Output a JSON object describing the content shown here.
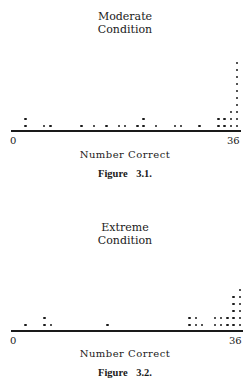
{
  "chart_data": [
    {
      "type": "scatter",
      "subtype": "dot-plot",
      "title": "Moderate Condition",
      "title_lines": [
        "Moderate",
        "Condition"
      ],
      "xlabel": "Number Correct",
      "ylabel": "",
      "xlim": [
        0,
        36
      ],
      "x_tick_labels": [
        "0",
        "36"
      ],
      "grid": false,
      "legend": null,
      "caption": "Figure 3.1.",
      "points": [
        {
          "score": 2,
          "count": 2
        },
        {
          "score": 5,
          "count": 1
        },
        {
          "score": 6,
          "count": 1
        },
        {
          "score": 11,
          "count": 1
        },
        {
          "score": 13,
          "count": 1
        },
        {
          "score": 15,
          "count": 1
        },
        {
          "score": 17,
          "count": 1
        },
        {
          "score": 18,
          "count": 1
        },
        {
          "score": 20,
          "count": 1
        },
        {
          "score": 21,
          "count": 2
        },
        {
          "score": 23,
          "count": 1
        },
        {
          "score": 26,
          "count": 1
        },
        {
          "score": 27,
          "count": 1
        },
        {
          "score": 30,
          "count": 1
        },
        {
          "score": 33,
          "count": 2
        },
        {
          "score": 34,
          "count": 2
        },
        {
          "score": 35,
          "count": 3
        },
        {
          "score": 36,
          "count": 10
        }
      ]
    },
    {
      "type": "scatter",
      "subtype": "dot-plot",
      "title": "Extreme Condition",
      "title_lines": [
        "Extreme",
        "Condition"
      ],
      "xlabel": "Number Correct",
      "ylabel": "",
      "xlim": [
        0,
        36
      ],
      "x_tick_labels": [
        "0",
        "36"
      ],
      "grid": false,
      "legend": null,
      "caption": "Figure 3.2.",
      "points": [
        {
          "score": 2,
          "count": 1
        },
        {
          "score": 5,
          "count": 2
        },
        {
          "score": 6,
          "count": 1
        },
        {
          "score": 15,
          "count": 1
        },
        {
          "score": 28,
          "count": 2
        },
        {
          "score": 29,
          "count": 2
        },
        {
          "score": 30,
          "count": 1
        },
        {
          "score": 32,
          "count": 2
        },
        {
          "score": 33,
          "count": 2
        },
        {
          "score": 34,
          "count": 2
        },
        {
          "score": 35,
          "count": 5
        },
        {
          "score": 36,
          "count": 6
        }
      ]
    }
  ],
  "figures": [
    {
      "title_line1": "Moderate",
      "title_line2": "Condition",
      "tick_min": "0",
      "tick_max": "36",
      "xlabel": "Number Correct",
      "caption": "Figure 3.1."
    },
    {
      "title_line1": "Extreme",
      "title_line2": "Condition",
      "tick_min": "0",
      "tick_max": "36",
      "xlabel": "Number Correct",
      "caption": "Figure 3.2."
    }
  ]
}
